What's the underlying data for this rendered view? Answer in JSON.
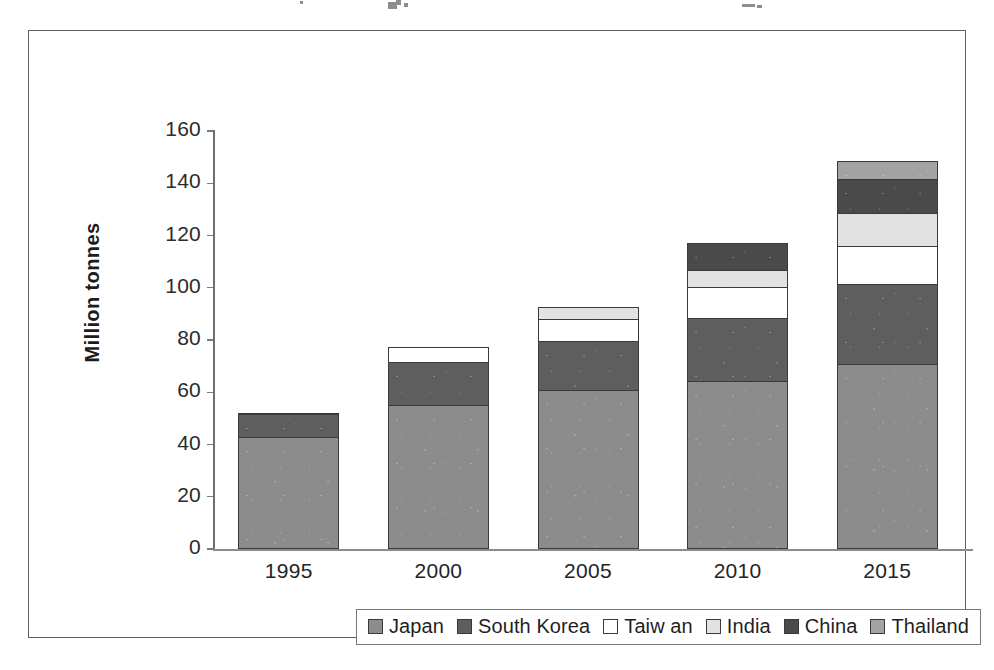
{
  "figure": {
    "caption": "",
    "y_axis_title": "Million tonnes"
  },
  "legend": {
    "items": [
      {
        "label": "Japan",
        "color": "#8c8c8c"
      },
      {
        "label": "South Korea",
        "color": "#5e5e5e"
      },
      {
        "label": "Taiw an",
        "color": "#ffffff"
      },
      {
        "label": "India",
        "color": "#e2e2e2"
      },
      {
        "label": "China",
        "color": "#4a4a4a"
      },
      {
        "label": "Thailand",
        "color": "#a3a3a3"
      }
    ]
  },
  "chart_data": {
    "type": "bar",
    "stacked": true,
    "title": "",
    "subtitle": "",
    "xlabel": "",
    "ylabel": "Million tonnes",
    "categories": [
      "1995",
      "2000",
      "2005",
      "2010",
      "2015"
    ],
    "ylim": [
      0,
      160
    ],
    "yticks": [
      0,
      20,
      40,
      60,
      80,
      100,
      120,
      140,
      160
    ],
    "ytick_labels": [
      "0",
      "20",
      "40",
      "60",
      "80",
      "100",
      "120",
      "140",
      "160"
    ],
    "grid": false,
    "legend_position": "bottom",
    "series": [
      {
        "name": "Japan",
        "color": "#8c8c8c",
        "values": [
          43,
          55,
          61,
          64.5,
          71
        ]
      },
      {
        "name": "South Korea",
        "color": "#5e5e5e",
        "values": [
          9,
          17,
          19,
          24.5,
          31
        ]
      },
      {
        "name": "Taiw an",
        "color": "#ffffff",
        "values": [
          1,
          6,
          9,
          12,
          15
        ]
      },
      {
        "name": "India",
        "color": "#e2e2e2",
        "values": [
          0,
          0,
          5,
          7,
          13
        ]
      },
      {
        "name": "China",
        "color": "#4a4a4a",
        "values": [
          0,
          0,
          0,
          11,
          13.5
        ]
      },
      {
        "name": "Thailand",
        "color": "#a3a3a3",
        "values": [
          0,
          0,
          0,
          0,
          7
        ]
      }
    ],
    "totals": [
      53,
      78,
      94,
      119,
      150.5
    ]
  }
}
